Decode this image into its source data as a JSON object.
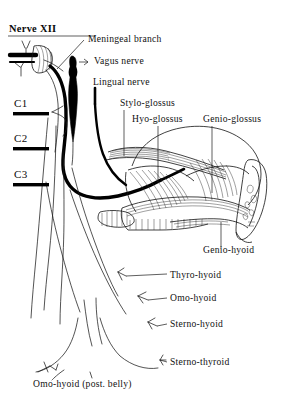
{
  "figure": {
    "title": "Nerve XII",
    "title_underline": true,
    "background_color": "#ffffff",
    "ink_color": "#000000",
    "width": 293,
    "height": 415
  },
  "spinal_segments": [
    {
      "label": "C1",
      "x": 14,
      "y": 103
    },
    {
      "label": "C2",
      "x": 14,
      "y": 138
    },
    {
      "label": "C3",
      "x": 14,
      "y": 174
    }
  ],
  "labels": [
    {
      "id": "meningeal-branch",
      "text": "Meningeal branch",
      "x": 88,
      "y": 42
    },
    {
      "id": "vagus-nerve",
      "text": "Vagus nerve",
      "x": 94,
      "y": 64
    },
    {
      "id": "lingual-nerve",
      "text": "Lingual nerve",
      "x": 93,
      "y": 85
    },
    {
      "id": "stylo-glossus",
      "text": "Stylo-glossus",
      "x": 120,
      "y": 106
    },
    {
      "id": "hyo-glossus",
      "text": "Hyo-glossus",
      "x": 132,
      "y": 122
    },
    {
      "id": "genio-glossus",
      "text": "Genio-glossus",
      "x": 203,
      "y": 122
    },
    {
      "id": "genio-hyoid",
      "text": "Genio-hyoid",
      "x": 203,
      "y": 253
    },
    {
      "id": "thyro-hyoid",
      "text": "Thyro-hyoid",
      "x": 170,
      "y": 278
    },
    {
      "id": "omo-hyoid",
      "text": "Omo-hyoid",
      "x": 170,
      "y": 301
    },
    {
      "id": "sterno-hyoid",
      "text": "Sterno-hyoid",
      "x": 170,
      "y": 327
    },
    {
      "id": "sterno-thyroid",
      "text": "Sterno-thyroid",
      "x": 170,
      "y": 365
    },
    {
      "id": "omo-hyoid-post",
      "text": "Omo-hyoid (post. belly)",
      "x": 33,
      "y": 387
    }
  ],
  "structures": [
    {
      "name": "hypoglossal-nerve-trunk",
      "kind": "nerve"
    },
    {
      "name": "hypoglossal-rootlets",
      "kind": "nerve"
    },
    {
      "name": "meningeal-branch-nerve",
      "kind": "nerve"
    },
    {
      "name": "vagus-nerve-trunk",
      "kind": "nerve"
    },
    {
      "name": "lingual-nerve-trunk",
      "kind": "nerve"
    },
    {
      "name": "stylo-glossus-muscle",
      "kind": "muscle"
    },
    {
      "name": "hyo-glossus-muscle",
      "kind": "muscle"
    },
    {
      "name": "genio-glossus-muscle",
      "kind": "muscle"
    },
    {
      "name": "genio-hyoid-muscle",
      "kind": "muscle"
    },
    {
      "name": "tongue-outline",
      "kind": "organ"
    },
    {
      "name": "mandible-bone",
      "kind": "bone"
    },
    {
      "name": "ansa-cervicalis",
      "kind": "nerve"
    },
    {
      "name": "descendens-hypoglossi",
      "kind": "nerve"
    }
  ]
}
